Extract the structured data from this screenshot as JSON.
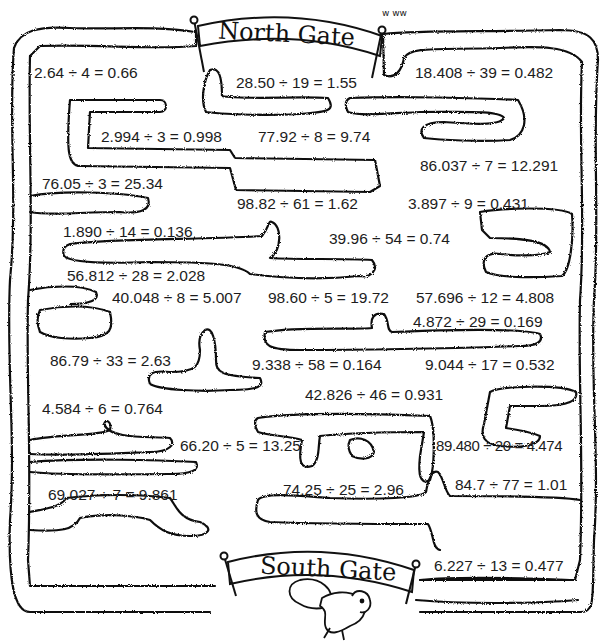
{
  "gates": {
    "north": "North Gate",
    "south": "South Gate"
  },
  "grass_doodle": "w ww",
  "equations": [
    {
      "text": "2.64 ÷ 4 = 0.66",
      "x": 34,
      "y": 64
    },
    {
      "text": "28.50 ÷ 19 = 1.55",
      "x": 236,
      "y": 74
    },
    {
      "text": "18.408 ÷ 39 = 0.482",
      "x": 415,
      "y": 64
    },
    {
      "text": "2.994 ÷ 3 = 0.998",
      "x": 101,
      "y": 128
    },
    {
      "text": "77.92 ÷ 8 = 9.74",
      "x": 258,
      "y": 128
    },
    {
      "text": "86.037 ÷ 7 = 12.291",
      "x": 420,
      "y": 157
    },
    {
      "text": "76.05 ÷ 3 = 25.34",
      "x": 42,
      "y": 175
    },
    {
      "text": "98.82 ÷ 61 = 1.62",
      "x": 237,
      "y": 195
    },
    {
      "text": "3.897 ÷ 9 = 0.431",
      "x": 408,
      "y": 195
    },
    {
      "text": "1.890 ÷ 14 = 0.136",
      "x": 63,
      "y": 223
    },
    {
      "text": "39.96 ÷ 54 = 0.74",
      "x": 329,
      "y": 230
    },
    {
      "text": "56.812 ÷ 28 = 2.028",
      "x": 67,
      "y": 267
    },
    {
      "text": "40.048 ÷ 8 = 5.007",
      "x": 112,
      "y": 289
    },
    {
      "text": "98.60 ÷ 5 = 19.72",
      "x": 268,
      "y": 289
    },
    {
      "text": "57.696 ÷ 12 = 4.808",
      "x": 416,
      "y": 289
    },
    {
      "text": "4.872 ÷ 29 = 0.169",
      "x": 413,
      "y": 313
    },
    {
      "text": "86.79 ÷ 33 = 2.63",
      "x": 50,
      "y": 352
    },
    {
      "text": "9.338 ÷ 58 = 0.164",
      "x": 252,
      "y": 356
    },
    {
      "text": "9.044 ÷ 17 = 0.532",
      "x": 425,
      "y": 356
    },
    {
      "text": "42.826 ÷ 46 = 0.931",
      "x": 305,
      "y": 386
    },
    {
      "text": "4.584 ÷ 6 = 0.764",
      "x": 42,
      "y": 400
    },
    {
      "text": "66.20 ÷ 5 = 13.25",
      "x": 180,
      "y": 437
    },
    {
      "text": "89.480 ÷ 20 = 4.474",
      "x": 436,
      "y": 437,
      "tight": true
    },
    {
      "text": "69.027 ÷ 7 = 9.861",
      "x": 48,
      "y": 486
    },
    {
      "text": "74.25 ÷ 25 = 2.96",
      "x": 283,
      "y": 481
    },
    {
      "text": "84.7 ÷ 77 = 1.01",
      "x": 455,
      "y": 476
    },
    {
      "text": "6.227 ÷ 13 = 0.477",
      "x": 434,
      "y": 557
    }
  ]
}
